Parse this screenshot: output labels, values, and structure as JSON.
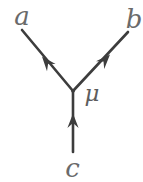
{
  "diagram": {
    "colors": {
      "background": "#ffffff",
      "line": "#3d3d3d",
      "label": "#6a6a6a"
    },
    "width": 143,
    "height": 182,
    "line_width": 2.6,
    "vertex": {
      "x": 73,
      "y": 91
    },
    "vertex_label": {
      "id": "mu",
      "text": "μ",
      "x": 92,
      "y": 101
    },
    "edges": [
      {
        "id": "a",
        "label": "a",
        "from": {
          "x": 73,
          "y": 91
        },
        "to": {
          "x": 22,
          "y": 30
        },
        "arrow": {
          "x": 42,
          "y": 56.5,
          "angle": -129.9
        },
        "label_pos": {
          "x": 22,
          "y": 25
        }
      },
      {
        "id": "b",
        "label": "b",
        "from": {
          "x": 73,
          "y": 91
        },
        "to": {
          "x": 128,
          "y": 32
        },
        "arrow": {
          "x": 110,
          "y": 54.5,
          "angle": -47
        },
        "label_pos": {
          "x": 134,
          "y": 28
        }
      },
      {
        "id": "c",
        "label": "c",
        "from": {
          "x": 73,
          "y": 152
        },
        "to": {
          "x": 73,
          "y": 91
        },
        "arrow": {
          "x": 73,
          "y": 113.5,
          "angle": -90
        },
        "label_pos": {
          "x": 72.5,
          "y": 177
        }
      }
    ]
  }
}
